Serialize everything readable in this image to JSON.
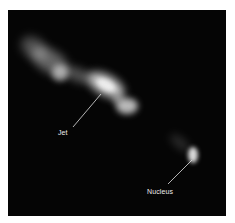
{
  "figure": {
    "labels": {
      "jet": "Jet",
      "nucleus": "Nucleus"
    },
    "colors": {
      "background": "#050505",
      "glow": "#d8d8d8",
      "label_text": "#ededed",
      "page": "#ffffff"
    }
  }
}
